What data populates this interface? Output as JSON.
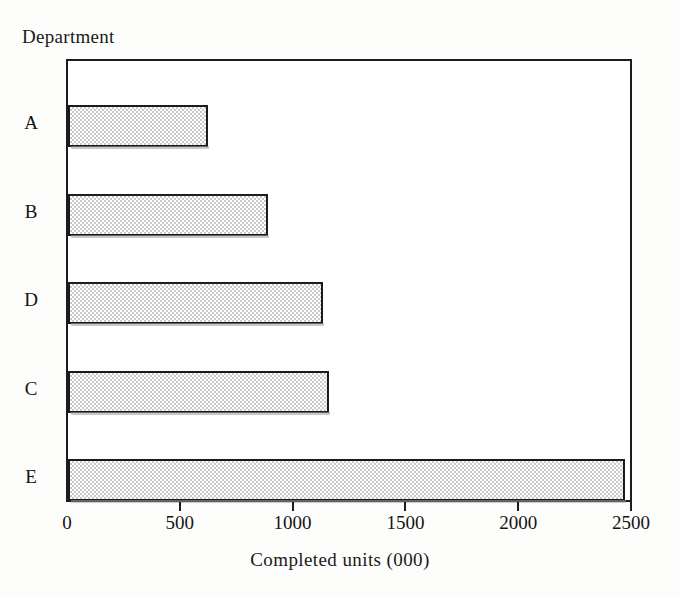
{
  "chart_data": {
    "type": "bar",
    "orientation": "horizontal",
    "title": "",
    "xlabel": "Completed units (000)",
    "ylabel": "Department",
    "categories": [
      "A",
      "B",
      "D",
      "C",
      "E"
    ],
    "values": [
      620,
      885,
      1130,
      1155,
      2470
    ],
    "xlim": [
      0,
      2500
    ],
    "xticks": [
      0,
      500,
      1000,
      1500,
      2000,
      2500
    ],
    "xtick_labels": [
      "0",
      "500",
      "1000",
      "1500",
      "2000",
      "2500"
    ],
    "grid": false,
    "legend": null,
    "series": [
      {
        "name": "Completed units",
        "values": [
          620,
          885,
          1130,
          1155,
          2470
        ]
      }
    ],
    "bar_fill": "stippled-gray",
    "bar_edge_color": "#1b1b1b",
    "bar_fill_color": "#c9c9c9",
    "axis_color": "#1c1c1c"
  },
  "axes": {
    "y_title": "Department",
    "x_title": "Completed units (000)"
  }
}
